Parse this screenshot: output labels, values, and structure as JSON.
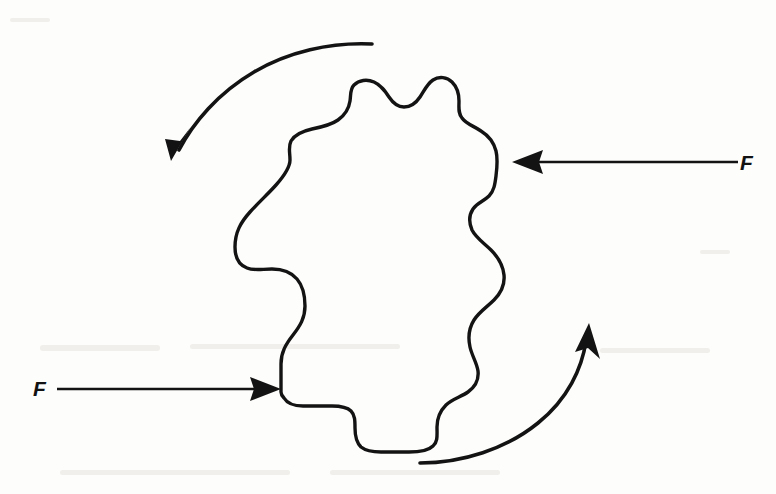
{
  "figure": {
    "background_color": "#fdfdfb",
    "ink_color": "#131313"
  },
  "labels": {
    "force_right": "F",
    "force_left": "F"
  },
  "forces": [
    {
      "name": "force-right",
      "label": "F",
      "direction": "left",
      "label_x": 740,
      "label_y": 168,
      "line_start_x": 738,
      "line_start_y": 162,
      "line_end_x": 535,
      "line_end_y": 162,
      "tip_x": 512,
      "tip_y": 162
    },
    {
      "name": "force-left",
      "label": "F",
      "direction": "right",
      "label_x": 34,
      "label_y": 394,
      "line_start_x": 57,
      "line_start_y": 389,
      "line_end_x": 258,
      "line_end_y": 389,
      "tip_x": 281,
      "tip_y": 389
    }
  ],
  "rotation_arrows": [
    {
      "name": "rotation-arrow-top",
      "sense": "counterclockwise",
      "start_x": 372,
      "start_y": 44,
      "end_x": 174,
      "end_y": 152,
      "tip_x": 171,
      "tip_y": 160
    },
    {
      "name": "rotation-arrow-bottom",
      "sense": "counterclockwise",
      "start_x": 420,
      "start_y": 463,
      "end_x": 586,
      "end_y": 333,
      "tip_x": 589,
      "tip_y": 323
    }
  ],
  "body_shape": {
    "name": "irregular-rigid-body",
    "fill": "none",
    "stroke_width": 3.4,
    "path": "M 512 162 L 512 162"
  }
}
